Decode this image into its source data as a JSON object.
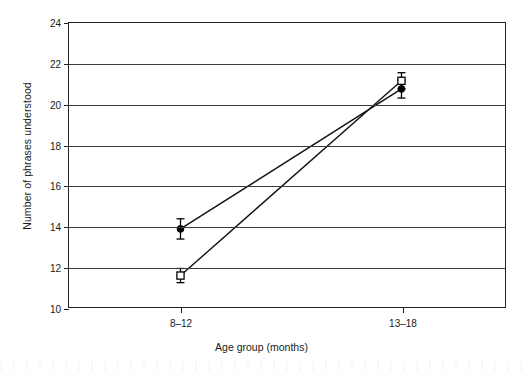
{
  "chart_data": {
    "type": "line",
    "title": "",
    "xlabel": "Age group (months)",
    "ylabel": "Number of phrases understood",
    "categories": [
      "8–12",
      "13–18"
    ],
    "ylim": [
      10,
      24
    ],
    "yticks": [
      10,
      12,
      14,
      16,
      18,
      20,
      22,
      24
    ],
    "ytick_labels": [
      "10",
      "12",
      "14",
      "16",
      "18",
      "20",
      "22",
      "24"
    ],
    "grid": "horizontal",
    "legend": "none",
    "series": [
      {
        "name": "filled-diamond-series",
        "marker": "filled-diamond",
        "values": [
          13.85,
          20.75
        ],
        "errors": [
          0.5,
          0.45
        ]
      },
      {
        "name": "open-square-series",
        "marker": "open-square",
        "values": [
          11.55,
          21.15
        ],
        "errors": [
          0.35,
          0.4
        ]
      }
    ],
    "annotations": []
  },
  "colors": {
    "axis": "#222222",
    "grid": "#3a3a3a",
    "series_line": "#111111",
    "marker_fill": "#000000",
    "marker_open_fill": "#ffffff",
    "background": "#ffffff"
  }
}
